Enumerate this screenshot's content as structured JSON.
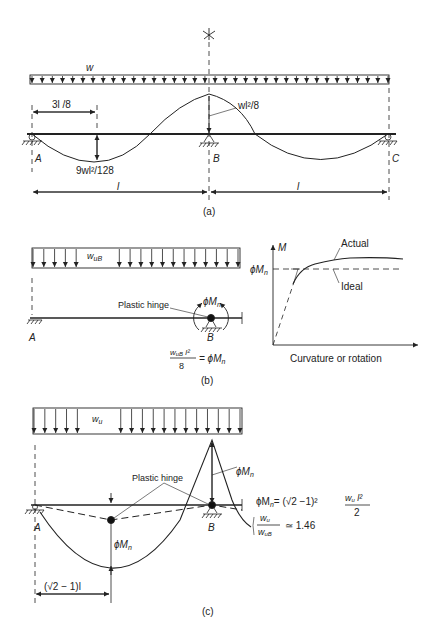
{
  "figure": {
    "panel_a": {
      "caption": "(a)",
      "load_label": "w",
      "dim_3l8": "3l /8",
      "neg_moment": "wl²/8",
      "pos_moment": "9wl²/128",
      "support_A": "A",
      "support_B": "B",
      "support_C": "C",
      "span_left": "l",
      "span_right": "l",
      "symmetry_mark": "✲"
    },
    "panel_b": {
      "caption": "(b)",
      "load_label": "w",
      "load_sub": "uB",
      "hinge_label": "Plastic hinge",
      "moment_label": "ϕM",
      "moment_sub": "n",
      "support_A": "A",
      "support_B": "B",
      "eq_num": "w",
      "eq_num_sub": "uB",
      "eq_num_tail": " l²",
      "eq_den": "8",
      "eq_rhs": "= ϕM",
      "eq_rhs_sub": "n",
      "graph": {
        "y_axis": "M",
        "x_axis": "Curvature or rotation",
        "level_label": "ϕM",
        "level_sub": "n",
        "actual": "Actual",
        "ideal": "Ideal"
      }
    },
    "panel_c": {
      "caption": "(c)",
      "load_label": "w",
      "load_sub": "u",
      "hinge_label": "Plastic hinge",
      "moment_top": "ϕM",
      "moment_top_sub": "n",
      "moment_mid": "ϕM",
      "moment_mid_sub": "n",
      "support_A": "A",
      "support_B": "B",
      "dim": "(√2 − 1)l",
      "eq1_lhs": "ϕM",
      "eq1_lhs_sub": "n",
      "eq1_mid": "= (√2 −1)²",
      "eq1_num": "w",
      "eq1_num_sub": "u",
      "eq1_num_tail": " l²",
      "eq1_den": "2",
      "eq2_num": "w",
      "eq2_num_sub": "u",
      "eq2_den": "w",
      "eq2_den_sub": "uB",
      "eq2_rhs": "≃ 1.46"
    }
  }
}
